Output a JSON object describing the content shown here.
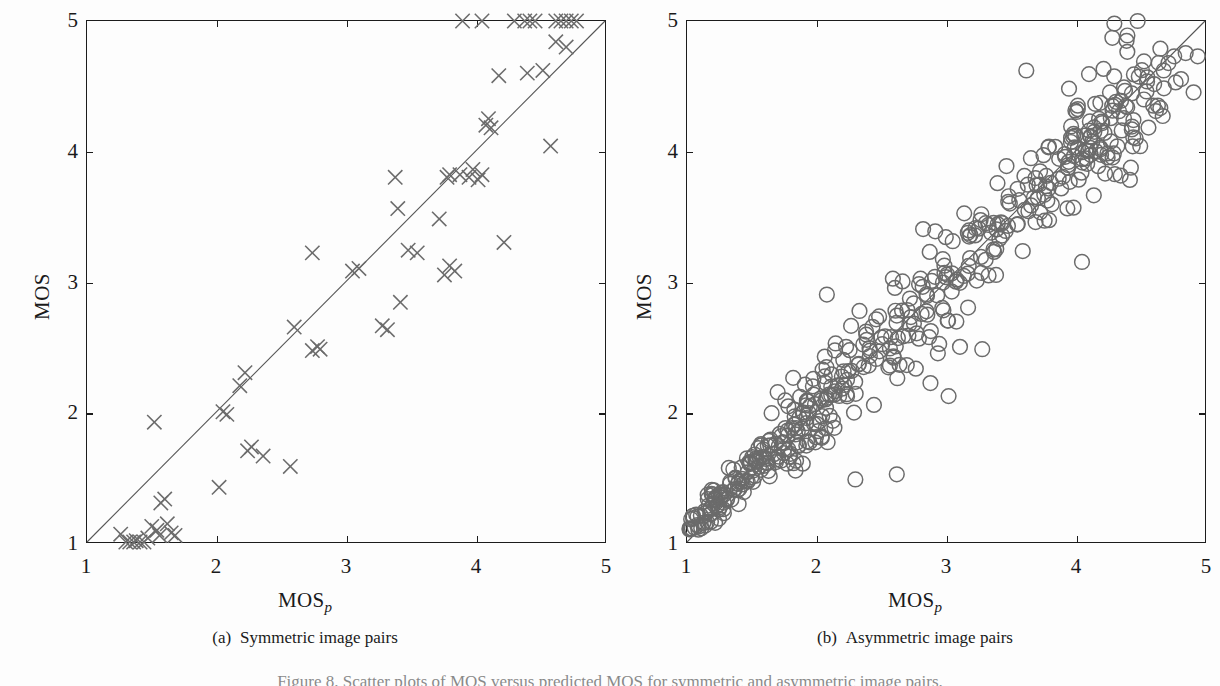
{
  "figure": {
    "bottom_caption": "Figure 8. Scatter plots of MOS versus predicted MOS for symmetric and asymmetric image pairs."
  },
  "panels": [
    {
      "id": "a",
      "caption_label": "(a)",
      "caption_text": "Symmetric image pairs",
      "xlabel_main": "MOS",
      "xlabel_sub": "p",
      "ylabel": "MOS",
      "xticks": [
        "1",
        "2",
        "3",
        "4",
        "5"
      ],
      "yticks": [
        "1",
        "2",
        "3",
        "4",
        "5"
      ],
      "marker": "cross-marker",
      "marker_color": "#6b6b6b",
      "line_color": "#555555"
    },
    {
      "id": "b",
      "caption_label": "(b)",
      "caption_text": "Asymmetric image pairs",
      "xlabel_main": "MOS",
      "xlabel_sub": "p",
      "ylabel": "MOS",
      "xticks": [
        "1",
        "2",
        "3",
        "4",
        "5"
      ],
      "yticks": [
        "1",
        "2",
        "3",
        "4",
        "5"
      ],
      "marker": "circle-marker",
      "marker_color": "#6b6b6b",
      "line_color": "#555555"
    }
  ],
  "chart_data": [
    {
      "type": "scatter",
      "panel": "a",
      "title": "Symmetric image pairs",
      "xlabel": "MOSp",
      "ylabel": "MOS",
      "xlim": [
        1,
        5
      ],
      "ylim": [
        1,
        5
      ],
      "xticks": [
        1,
        2,
        3,
        4,
        5
      ],
      "yticks": [
        1,
        2,
        3,
        4,
        5
      ],
      "grid": false,
      "legend": "none",
      "marker": "x",
      "reference_line": {
        "from": [
          1,
          1
        ],
        "to": [
          5,
          5
        ],
        "label": "identity"
      },
      "points": [
        [
          1.26,
          1.06
        ],
        [
          1.3,
          1.0
        ],
        [
          1.33,
          1.0
        ],
        [
          1.36,
          1.0
        ],
        [
          1.38,
          1.01
        ],
        [
          1.41,
          1.0
        ],
        [
          1.44,
          1.0
        ],
        [
          1.47,
          1.03
        ],
        [
          1.52,
          1.92
        ],
        [
          1.5,
          1.12
        ],
        [
          1.54,
          1.09
        ],
        [
          1.57,
          1.3
        ],
        [
          1.6,
          1.33
        ],
        [
          1.56,
          1.05
        ],
        [
          1.62,
          1.14
        ],
        [
          1.65,
          1.07
        ],
        [
          1.68,
          1.05
        ],
        [
          2.02,
          1.42
        ],
        [
          2.05,
          2.0
        ],
        [
          2.08,
          1.98
        ],
        [
          2.18,
          2.2
        ],
        [
          2.22,
          2.3
        ],
        [
          2.24,
          1.7
        ],
        [
          2.27,
          1.73
        ],
        [
          2.36,
          1.66
        ],
        [
          2.57,
          1.58
        ],
        [
          2.6,
          2.65
        ],
        [
          2.74,
          2.47
        ],
        [
          2.78,
          2.5
        ],
        [
          2.8,
          2.48
        ],
        [
          2.74,
          3.22
        ],
        [
          3.05,
          3.08
        ],
        [
          3.1,
          3.1
        ],
        [
          3.28,
          2.66
        ],
        [
          3.32,
          2.63
        ],
        [
          3.4,
          3.56
        ],
        [
          3.42,
          2.84
        ],
        [
          3.48,
          3.24
        ],
        [
          3.38,
          3.8
        ],
        [
          3.55,
          3.22
        ],
        [
          3.72,
          3.48
        ],
        [
          3.78,
          3.8
        ],
        [
          3.8,
          3.82
        ],
        [
          3.76,
          3.05
        ],
        [
          3.8,
          3.12
        ],
        [
          3.84,
          3.08
        ],
        [
          3.88,
          3.82
        ],
        [
          3.95,
          3.8
        ],
        [
          3.98,
          3.86
        ],
        [
          4.02,
          3.78
        ],
        [
          4.05,
          3.82
        ],
        [
          4.08,
          4.2
        ],
        [
          4.1,
          4.25
        ],
        [
          4.12,
          4.18
        ],
        [
          4.22,
          3.3
        ],
        [
          4.18,
          4.58
        ],
        [
          4.4,
          4.6
        ],
        [
          4.52,
          4.62
        ],
        [
          4.58,
          4.04
        ],
        [
          4.62,
          4.84
        ],
        [
          4.7,
          4.8
        ],
        [
          4.3,
          5.0
        ],
        [
          4.38,
          5.0
        ],
        [
          4.42,
          5.0
        ],
        [
          4.46,
          5.0
        ],
        [
          4.62,
          5.0
        ],
        [
          4.66,
          5.0
        ],
        [
          4.7,
          5.0
        ],
        [
          4.74,
          5.0
        ],
        [
          4.78,
          5.0
        ],
        [
          3.9,
          5.0
        ],
        [
          4.05,
          5.0
        ]
      ]
    },
    {
      "type": "scatter",
      "panel": "b",
      "title": "Asymmetric image pairs",
      "xlabel": "MOSp",
      "ylabel": "MOS",
      "xlim": [
        1,
        5
      ],
      "ylim": [
        1,
        5
      ],
      "xticks": [
        1,
        2,
        3,
        4,
        5
      ],
      "yticks": [
        1,
        2,
        3,
        4,
        5
      ],
      "grid": false,
      "legend": "none",
      "marker": "o",
      "reference_line": {
        "from": [
          1,
          1
        ],
        "to": [
          5,
          5
        ],
        "label": "identity"
      },
      "n_points": 500,
      "description": "Dense elongated cloud of open circles following the identity line from (1,1) to (5,5); spread widest around MOS 1.2-2.0 and 3.0-4.5; a few outliers at high MOSp with low MOS."
    }
  ]
}
